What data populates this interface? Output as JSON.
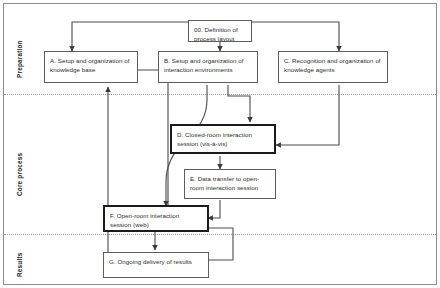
{
  "diagram": {
    "bands": [
      {
        "id": "preparation",
        "label": "Preparation"
      },
      {
        "id": "core-process",
        "label": "Core process"
      },
      {
        "id": "results",
        "label": "Results"
      }
    ],
    "nodes": [
      {
        "id": "node-00",
        "label": "00. Definition of process layout",
        "band": "preparation",
        "emphasis": "normal"
      },
      {
        "id": "node-a",
        "label": "A. Setup and organization of knowledge base",
        "band": "preparation",
        "emphasis": "normal"
      },
      {
        "id": "node-b",
        "label": "B. Setup and organization of interaction environments",
        "band": "preparation",
        "emphasis": "normal"
      },
      {
        "id": "node-c",
        "label": "C. Recognition and organization of knowledge agents",
        "band": "preparation",
        "emphasis": "normal"
      },
      {
        "id": "node-d",
        "label": "D. Closed-room interaction session (vis-à-vis)",
        "band": "core-process",
        "emphasis": "bold"
      },
      {
        "id": "node-e",
        "label": "E. Data transfer to open-room interaction session",
        "band": "core-process",
        "emphasis": "normal"
      },
      {
        "id": "node-f",
        "label": "F. Open-room interaction session (web)",
        "band": "core-process",
        "emphasis": "bold"
      },
      {
        "id": "node-g",
        "label": "G. Ongoing delivery of results",
        "band": "results",
        "emphasis": "normal"
      }
    ],
    "edges": [
      {
        "from": "node-00",
        "to": "node-a"
      },
      {
        "from": "node-00",
        "to": "node-b"
      },
      {
        "from": "node-00",
        "to": "node-c"
      },
      {
        "from": "node-b",
        "to": "node-d"
      },
      {
        "from": "node-b",
        "to": "node-f"
      },
      {
        "from": "node-c",
        "to": "node-d"
      },
      {
        "from": "node-a",
        "to": "node-f"
      },
      {
        "from": "node-d",
        "to": "node-e"
      },
      {
        "from": "node-e",
        "to": "node-f"
      },
      {
        "from": "node-f",
        "to": "node-a"
      },
      {
        "from": "node-f",
        "to": "node-g"
      }
    ],
    "colors": {
      "background": "#ffffff",
      "frame": "#8a8a8a",
      "node_border": "#5d5d5d",
      "node_border_bold": "#1b1b1b",
      "text": "#2b2b2b",
      "wire": "#4a4a4a",
      "divider": "#9a9a9a"
    }
  }
}
